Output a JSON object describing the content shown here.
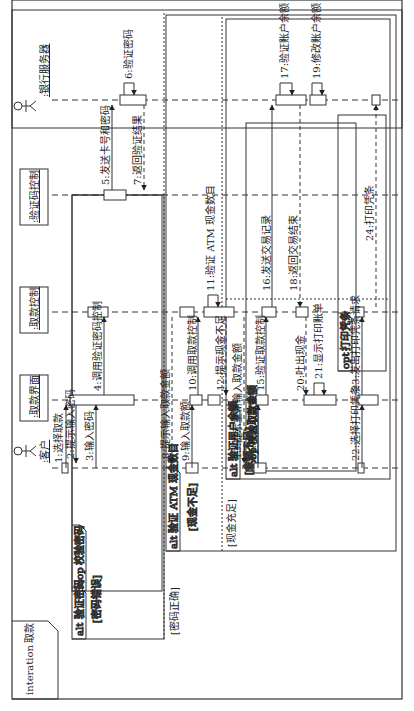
{
  "frame": {
    "keyword": "interation",
    "name": "取款"
  },
  "participants": [
    {
      "id": "customer",
      "label": ":客户",
      "kind": "actor"
    },
    {
      "id": "ui",
      "label": ":取款界面",
      "kind": "object"
    },
    {
      "id": "ctrl",
      "label": ":取款控制",
      "kind": "object"
    },
    {
      "id": "verify",
      "label": ":验证码控制",
      "kind": "object"
    },
    {
      "id": "bank",
      "label": ":银行服务器",
      "kind": "actor"
    }
  ],
  "messages": [
    {
      "n": 1,
      "label": "1:选择取款",
      "from": "customer",
      "to": "ui"
    },
    {
      "n": 2,
      "label": "2:提示输入密码",
      "from": "ui",
      "to": "customer"
    },
    {
      "n": 3,
      "label": "3:输入密码",
      "from": "customer",
      "to": "ui"
    },
    {
      "n": 4,
      "label": "4:调用验证密码控制",
      "from": "ui",
      "to": "ctrl"
    },
    {
      "n": 5,
      "label": "5:发送卡号和密码",
      "from": "verify",
      "to": "bank"
    },
    {
      "n": 6,
      "label": "6:验证密码",
      "from": "bank",
      "to": "bank"
    },
    {
      "n": 7,
      "label": "7:返回验证结果",
      "from": "bank",
      "to": "verify"
    },
    {
      "n": 8,
      "label": "8:提示输入取款金额",
      "from": "ctrl",
      "to": "customer"
    },
    {
      "n": 9,
      "label": "9:输入取款额",
      "from": "customer",
      "to": "ui"
    },
    {
      "n": 10,
      "label": "10:调用取款控制",
      "from": "ui",
      "to": "ctrl"
    },
    {
      "n": 11,
      "label": "11:验证 ATM 现金数目",
      "from": "ctrl",
      "to": "ctrl"
    },
    {
      "n": 12,
      "label": "12:提示现金不足",
      "from": "ctrl",
      "to": "ui"
    },
    {
      "n": 13,
      "label": "13:提示重新输入取款金额",
      "from": "ctrl",
      "to": "customer"
    },
    {
      "n": 14,
      "label": "14:输入取款额",
      "from": "customer",
      "to": "ui"
    },
    {
      "n": 15,
      "label": "15:验证取款控制",
      "from": "ui",
      "to": "ctrl"
    },
    {
      "n": 16,
      "label": "16:发送交易记录",
      "from": "ctrl",
      "to": "bank"
    },
    {
      "n": 17,
      "label": "17:验证账户余额",
      "from": "bank",
      "to": "bank"
    },
    {
      "n": 18,
      "label": "18:返回交易结束",
      "from": "bank",
      "to": "ctrl"
    },
    {
      "n": 19,
      "label": "19:修改账户余额",
      "from": "bank",
      "to": "bank"
    },
    {
      "n": 20,
      "label": "20:吐出现金",
      "from": "ctrl",
      "to": "ui"
    },
    {
      "n": 21,
      "label": "21:显示打印账单",
      "from": "ui",
      "to": "ui"
    },
    {
      "n": 22,
      "label": "22:选择打印凭条",
      "from": "customer",
      "to": "ui"
    },
    {
      "n": 23,
      "label": "23:发出打印凭条请求",
      "from": "ui",
      "to": "ctrl"
    },
    {
      "n": 24,
      "label": "24:打印凭条",
      "from": "ctrl",
      "to": "bank"
    }
  ],
  "fragments": {
    "alt_password": {
      "op": "alt",
      "title": "验证密码",
      "guard1": "[密码错误]",
      "guard2": "[密码正确]"
    },
    "loop_password": {
      "op": "loop",
      "title": "校验密码"
    },
    "alt_atm": {
      "op": "alt",
      "title": "验证 ATM 现金数目",
      "guard1": "[现金不足]",
      "guard2": "[现金充足]"
    },
    "alt_balance": {
      "op": "alt",
      "title": "验证用户余额",
      "guard1": "[余额不足]"
    },
    "loop_amount": {
      "op": "loop",
      "title": "校验取款金额"
    },
    "opt_print": {
      "op": "opt",
      "title": "打印凭条"
    }
  }
}
